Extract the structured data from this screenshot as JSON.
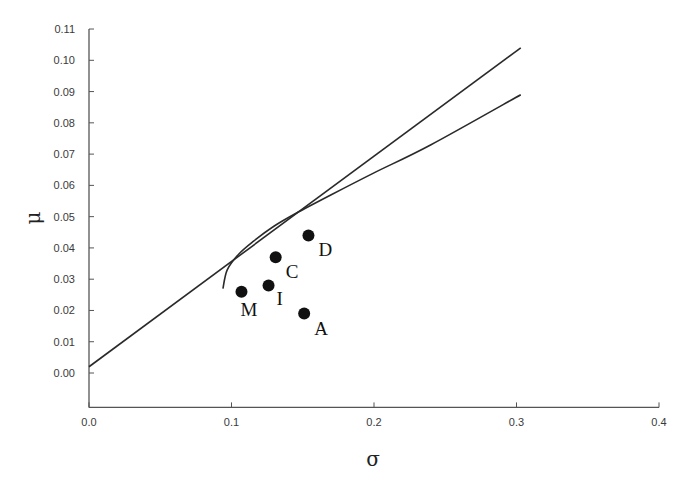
{
  "chart_data": {
    "type": "line",
    "title": "",
    "xlabel": "σ",
    "ylabel": "μ",
    "xlim": [
      0.0,
      0.4
    ],
    "ylim": [
      -0.011,
      0.11
    ],
    "grid": false,
    "legend": null,
    "x_ticks": [
      "0.0",
      "0.1",
      "0.2",
      "0.3",
      "0.4"
    ],
    "y_ticks": [
      "0.00",
      "0.01",
      "0.02",
      "0.03",
      "0.04",
      "0.05",
      "0.06",
      "0.07",
      "0.08",
      "0.09",
      "0.10",
      "0.11"
    ],
    "series": [
      {
        "name": "capital market line",
        "kind": "line",
        "x": [
          0.0,
          0.303
        ],
        "y": [
          0.002,
          0.104
        ]
      },
      {
        "name": "efficient frontier",
        "kind": "curve",
        "x": [
          0.094,
          0.097,
          0.105,
          0.115,
          0.13,
          0.145,
          0.17,
          0.2,
          0.24,
          0.303
        ],
        "y": [
          0.027,
          0.033,
          0.038,
          0.042,
          0.047,
          0.051,
          0.057,
          0.064,
          0.073,
          0.089
        ]
      },
      {
        "name": "assets",
        "kind": "scatter",
        "points": [
          {
            "label": "M",
            "x": 0.107,
            "y": 0.026
          },
          {
            "label": "I",
            "x": 0.126,
            "y": 0.028
          },
          {
            "label": "C",
            "x": 0.131,
            "y": 0.037
          },
          {
            "label": "D",
            "x": 0.154,
            "y": 0.044
          },
          {
            "label": "A",
            "x": 0.151,
            "y": 0.019
          }
        ]
      }
    ]
  }
}
